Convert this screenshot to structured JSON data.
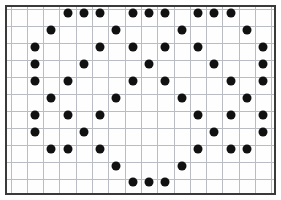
{
  "canvas": {
    "width": 281,
    "height": 200,
    "background_color": "#ffffff"
  },
  "frame": {
    "label": "dot grid plot frame",
    "x": 5,
    "y": 5,
    "width": 271,
    "height": 190,
    "border_color": "#3a3a3a",
    "border_width": 2,
    "fill_color": "#fefefe"
  },
  "grid": {
    "line_color": "#b9bcc2",
    "line_width": 1,
    "cell_width": 16.3,
    "cell_height": 17.0,
    "origin_x": 5.5,
    "origin_y": 4.0,
    "columns": 17,
    "rows": 11
  },
  "chart_data": {
    "type": "scatter",
    "title": "",
    "subtitle": "",
    "xlabel": "",
    "ylabel": "",
    "grid": true,
    "legend": null,
    "marker": {
      "shape": "circle",
      "color": "#111111",
      "diameter_px": 9
    },
    "xlim": [
      0,
      16
    ],
    "ylim": [
      0,
      10
    ],
    "x_tick_labels": [],
    "y_tick_labels": [],
    "point_count": 59,
    "points": [
      {
        "col": 3.5,
        "row": 0.25
      },
      {
        "col": 4.5,
        "row": 0.25
      },
      {
        "col": 5.5,
        "row": 0.25
      },
      {
        "col": 7.5,
        "row": 0.25
      },
      {
        "col": 8.5,
        "row": 0.25
      },
      {
        "col": 9.5,
        "row": 0.25
      },
      {
        "col": 11.5,
        "row": 0.25
      },
      {
        "col": 12.5,
        "row": 0.25
      },
      {
        "col": 13.5,
        "row": 0.25
      },
      {
        "col": 2.5,
        "row": 1.25
      },
      {
        "col": 6.5,
        "row": 1.25
      },
      {
        "col": 10.5,
        "row": 1.25
      },
      {
        "col": 14.5,
        "row": 1.25
      },
      {
        "col": 1.5,
        "row": 2.25
      },
      {
        "col": 5.5,
        "row": 2.25
      },
      {
        "col": 7.5,
        "row": 2.25
      },
      {
        "col": 9.5,
        "row": 2.25
      },
      {
        "col": 11.5,
        "row": 2.25
      },
      {
        "col": 15.5,
        "row": 2.25
      },
      {
        "col": 1.5,
        "row": 3.25
      },
      {
        "col": 4.5,
        "row": 3.25
      },
      {
        "col": 8.5,
        "row": 3.25
      },
      {
        "col": 12.5,
        "row": 3.25
      },
      {
        "col": 15.5,
        "row": 3.25
      },
      {
        "col": 1.5,
        "row": 4.25
      },
      {
        "col": 3.5,
        "row": 4.25
      },
      {
        "col": 7.5,
        "row": 4.25
      },
      {
        "col": 9.5,
        "row": 4.25
      },
      {
        "col": 13.5,
        "row": 4.25
      },
      {
        "col": 15.5,
        "row": 4.25
      },
      {
        "col": 2.5,
        "row": 5.25
      },
      {
        "col": 6.5,
        "row": 5.25
      },
      {
        "col": 10.5,
        "row": 5.25
      },
      {
        "col": 14.5,
        "row": 5.25
      },
      {
        "col": 1.5,
        "row": 6.25
      },
      {
        "col": 3.5,
        "row": 6.25
      },
      {
        "col": 5.5,
        "row": 6.25
      },
      {
        "col": 11.5,
        "row": 6.25
      },
      {
        "col": 13.5,
        "row": 6.25
      },
      {
        "col": 15.5,
        "row": 6.25
      },
      {
        "col": 1.5,
        "row": 7.25
      },
      {
        "col": 4.5,
        "row": 7.25
      },
      {
        "col": 12.5,
        "row": 7.25
      },
      {
        "col": 15.5,
        "row": 7.25
      },
      {
        "col": 2.5,
        "row": 8.25
      },
      {
        "col": 3.5,
        "row": 8.25
      },
      {
        "col": 5.5,
        "row": 8.25
      },
      {
        "col": 11.5,
        "row": 8.25
      },
      {
        "col": 13.5,
        "row": 8.25
      },
      {
        "col": 14.5,
        "row": 8.25
      },
      {
        "col": 6.5,
        "row": 9.25
      },
      {
        "col": 10.5,
        "row": 9.25
      },
      {
        "col": 7.5,
        "row": 10.2
      },
      {
        "col": 8.5,
        "row": 10.2
      },
      {
        "col": 9.5,
        "row": 10.2
      }
    ]
  }
}
